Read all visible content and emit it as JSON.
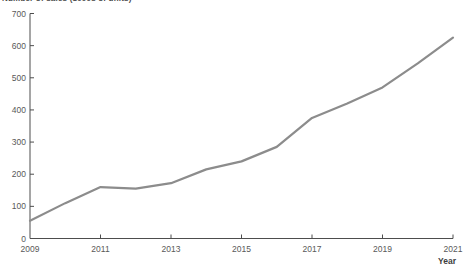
{
  "figure": {
    "title_clipped": "Number of sales (1000s of units)",
    "note": "title text is cropped at the top edge of the image"
  },
  "chart_data": {
    "type": "line",
    "x": [
      2009,
      2010,
      2011,
      2012,
      2013,
      2014,
      2015,
      2016,
      2017,
      2018,
      2019,
      2020,
      2021
    ],
    "values": [
      55,
      110,
      160,
      155,
      172,
      215,
      240,
      285,
      375,
      420,
      470,
      545,
      625
    ],
    "series_name": "units",
    "title": "Number of sales (1000s of units)",
    "xlabel": "Year",
    "ylabel": "",
    "xlim": [
      2009,
      2021
    ],
    "ylim": [
      0,
      700
    ],
    "y_ticks": [
      0,
      100,
      200,
      300,
      400,
      500,
      600,
      700
    ],
    "x_tick_labels": [
      "2009",
      "2011",
      "2013",
      "2015",
      "2017",
      "2019",
      "2021"
    ],
    "grid": false,
    "legend_position": "none",
    "line_color": "#8c8c8c",
    "line_width": 2.2,
    "axis_color": "#4d4d4d",
    "tick_label_color": "#595959",
    "x_axis_title_color": "#3d3d3d"
  },
  "layout": {
    "plot": {
      "left": 30,
      "right": 453,
      "top": 13.5,
      "bottom": 238.5
    },
    "tick_len": 4
  }
}
